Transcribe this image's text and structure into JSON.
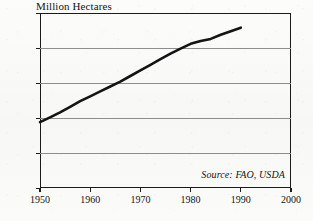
{
  "chart_data": {
    "type": "line",
    "title": "Million Hectares",
    "xlabel": "",
    "ylabel": "Million Hectares",
    "xlim": [
      1950,
      2000
    ],
    "ylim": [
      0,
      250
    ],
    "grid": true,
    "legend": null,
    "annotations": [
      {
        "name": "source",
        "text": "Source: FAO, USDA"
      }
    ],
    "x_ticks": [
      {
        "value": 1950,
        "label": "1950"
      },
      {
        "value": 1960,
        "label": "1960"
      },
      {
        "value": 1970,
        "label": "1970"
      },
      {
        "value": 1980,
        "label": "1980"
      },
      {
        "value": 1990,
        "label": "1990"
      },
      {
        "value": 2000,
        "label": "2000"
      }
    ],
    "y_ticks": [
      {
        "value": 250,
        "label": "250"
      },
      {
        "value": 200,
        "label": "200"
      },
      {
        "value": 150,
        "label": "150"
      },
      {
        "value": 100,
        "label": "100"
      },
      {
        "value": 50,
        "label": "50"
      },
      {
        "value": 0,
        "label": "0"
      }
    ],
    "series": [
      {
        "name": "Irrigated Area",
        "color": "#141414",
        "x": [
          1950,
          1952,
          1954,
          1956,
          1958,
          1960,
          1962,
          1964,
          1966,
          1968,
          1970,
          1972,
          1974,
          1976,
          1978,
          1980,
          1982,
          1984,
          1986,
          1988,
          1990
        ],
        "values": [
          94,
          101,
          108,
          116,
          124,
          131,
          138,
          145,
          152,
          160,
          168,
          176,
          184,
          192,
          199,
          206,
          210,
          213,
          219,
          224,
          229
        ]
      }
    ]
  },
  "figure": {
    "background_color": "#fbfbfa",
    "axis_color": "#1b1b1b",
    "grid_color": "#8d8d8d"
  }
}
